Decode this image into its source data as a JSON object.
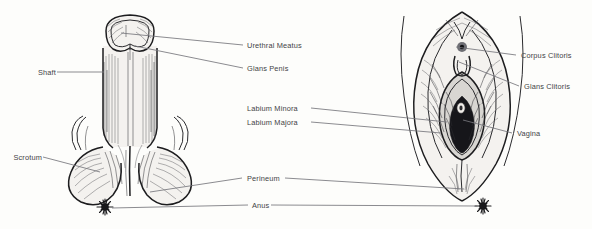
{
  "page": {
    "title_fragment": "··· ·· ······· ·····",
    "background_color": "#fdfdfb",
    "ink_color": "#1d1d1f",
    "label_color": "#434346",
    "leader_color": "#76767c"
  },
  "figures": [
    {
      "id": "male-external-genitalia",
      "name": "Male external genitalia illustration",
      "side": "left",
      "style": "pen-and-ink cross-hatch drawing"
    },
    {
      "id": "female-external-genitalia",
      "name": "Female external genitalia (vulva) illustration",
      "side": "right",
      "style": "pen-and-ink cross-hatch drawing"
    }
  ],
  "labels": {
    "shaft": "Shaft",
    "scrotum": "Scrotum",
    "urethral_meatus": "Urethral Meatus",
    "glans_penis": "Glans Penis",
    "labium_minora": "Labium Minora",
    "labium_majora": "Labium Majora",
    "perineum": "Perineum",
    "anus": "Anus",
    "corpus_clitoris": "Corpus Clitoris",
    "glans_clitoris": "Glans Clitoris",
    "vagina": "Vagina"
  }
}
